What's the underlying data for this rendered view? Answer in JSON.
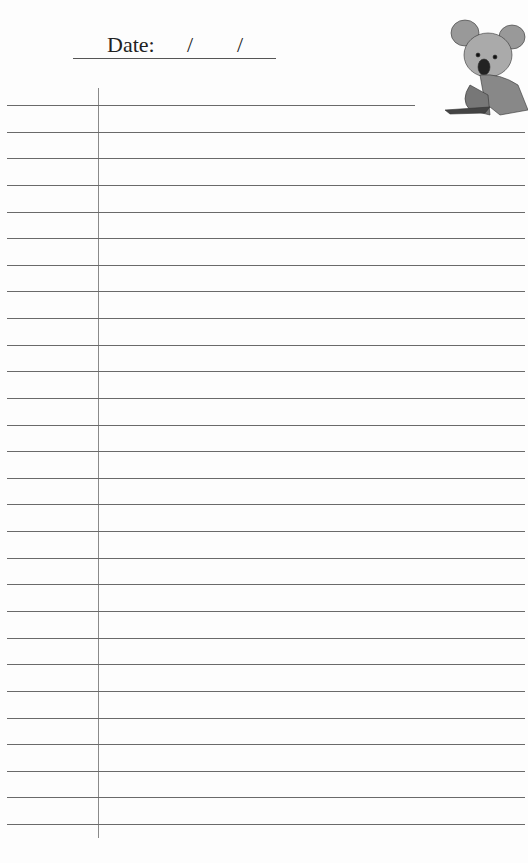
{
  "header": {
    "date_label": "Date:",
    "slash1": "/",
    "slash2": "/"
  },
  "page": {
    "ruled_lines": 28,
    "illustration": "koala-illustration"
  }
}
